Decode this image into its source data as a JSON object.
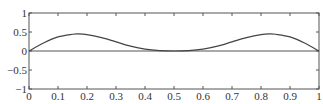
{
  "chart_data": {
    "type": "line",
    "title": "",
    "xlabel": "",
    "ylabel": "",
    "xlim": [
      0,
      1
    ],
    "ylim": [
      -1,
      1
    ],
    "grid": false,
    "legend": null,
    "x_ticks": [
      "0",
      "0.1",
      "0.2",
      "0.3",
      "0.4",
      "0.5",
      "0.6",
      "0.7",
      "0.8",
      "0.9",
      "1"
    ],
    "x_tick_values": [
      0,
      0.1,
      0.2,
      0.3,
      0.4,
      0.5,
      0.6,
      0.7,
      0.8,
      0.9,
      1.0
    ],
    "y_ticks": [
      "1",
      "0.5",
      "0",
      "−0.5",
      "−1"
    ],
    "y_tick_values": [
      1,
      0.5,
      0,
      -0.5,
      -1
    ],
    "reference_lines": [
      {
        "orientation": "horizontal",
        "y": 0
      }
    ],
    "series": [
      {
        "name": "curve",
        "color": "#444444",
        "x": [
          0,
          0.05,
          0.1,
          0.15,
          0.17,
          0.2,
          0.25,
          0.3,
          0.35,
          0.4,
          0.45,
          0.5,
          0.55,
          0.6,
          0.65,
          0.7,
          0.75,
          0.8,
          0.83,
          0.85,
          0.9,
          0.95,
          1.0
        ],
        "y": [
          0,
          0.21,
          0.37,
          0.44,
          0.45,
          0.43,
          0.35,
          0.24,
          0.13,
          0.05,
          0.01,
          0,
          0.01,
          0.05,
          0.13,
          0.24,
          0.35,
          0.43,
          0.45,
          0.44,
          0.37,
          0.21,
          0
        ]
      }
    ]
  },
  "colors": {
    "axis": "#555555",
    "curve": "#444444",
    "text": "#333333",
    "background": "#ffffff"
  }
}
